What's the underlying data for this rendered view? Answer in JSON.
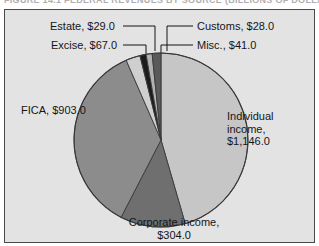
{
  "caption": {
    "text": "FIGURE 14.1    FEDERAL REVENUES BY SOURCE (BILLIONS OF DOLLARS)"
  },
  "panel": {
    "background_color": "#e3e3e3",
    "border_color": "#4a4a4a"
  },
  "labels": {
    "estate": "Estate, $29.0",
    "excise": "Excise, $67.0",
    "customs": "Customs, $28.0",
    "misc": "Misc., $41.0",
    "fica": "FICA, $903.0",
    "individual": "Individual income, $1,146.0",
    "corporate": "Corporate income, $304.0"
  },
  "chart_data": {
    "type": "pie",
    "title": "",
    "xlabel": "",
    "ylabel": "",
    "total": 2518.0,
    "units": "billions of dollars",
    "start_angle_deg": 0,
    "direction": "clockwise",
    "legend_position": "callout-labels",
    "grid": false,
    "categories": [
      "Individual income",
      "Corporate income",
      "FICA",
      "Excise",
      "Estate",
      "Customs",
      "Misc."
    ],
    "values": [
      1146.0,
      304.0,
      903.0,
      67.0,
      29.0,
      28.0,
      41.0
    ],
    "value_labels": [
      "$1,146.0",
      "$304.0",
      "$903.0",
      "$67.0",
      "$29.0",
      "$28.0",
      "$41.0"
    ],
    "colors": [
      "#c6c6c6",
      "#6f6f6f",
      "#8c8c8c",
      "#cfcfcf",
      "#1b1b1b",
      "#b2b2b2",
      "#5a5a5a"
    ],
    "slices": [
      {
        "name": "Individual income",
        "value": 1146.0,
        "label": "Individual income, $1,146.0",
        "color": "#c6c6c6",
        "percent": 45.5
      },
      {
        "name": "Corporate income",
        "value": 304.0,
        "label": "Corporate income, $304.0",
        "color": "#6f6f6f",
        "percent": 12.1
      },
      {
        "name": "FICA",
        "value": 903.0,
        "label": "FICA, $903.0",
        "color": "#8c8c8c",
        "percent": 35.9
      },
      {
        "name": "Excise",
        "value": 67.0,
        "label": "Excise, $67.0",
        "color": "#cfcfcf",
        "percent": 2.7
      },
      {
        "name": "Estate",
        "value": 29.0,
        "label": "Estate, $29.0",
        "color": "#1b1b1b",
        "percent": 1.2
      },
      {
        "name": "Customs",
        "value": 28.0,
        "label": "Customs, $28.0",
        "color": "#b2b2b2",
        "percent": 1.1
      },
      {
        "name": "Misc.",
        "value": 41.0,
        "label": "Misc., $41.0",
        "color": "#5a5a5a",
        "percent": 1.6
      }
    ]
  }
}
